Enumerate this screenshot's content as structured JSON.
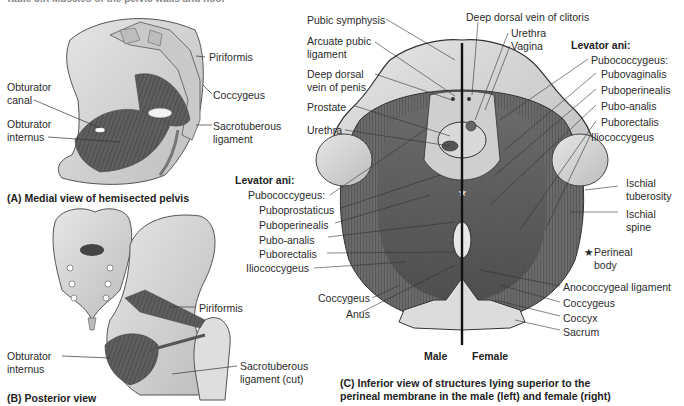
{
  "header_truncated": "Table 3.X Muscles of the pelvic walls and floor",
  "panel_a": {
    "caption": "(A) Medial view of hemisected pelvis",
    "labels": {
      "piriformis": "Piriformis",
      "coccygeus": "Coccygeus",
      "sacrotuberous_1": "Sacrotuberous",
      "sacrotuberous_2": "ligament",
      "obturator_canal_1": "Obturator",
      "obturator_canal_2": "canal",
      "obturator_internus_1": "Obturator",
      "obturator_internus_2": "internus"
    }
  },
  "panel_b": {
    "caption": "(B) Posterior view",
    "labels": {
      "piriformis": "Piriformis",
      "obturator_internus_1": "Obturator",
      "obturator_internus_2": "internus",
      "sacrotuberous_1": "Sacrotuberous",
      "sacrotuberous_2": "ligament (cut)"
    }
  },
  "panel_c": {
    "caption_1": "(C) Inferior view of structures lying superior to the",
    "caption_2": "perineal membrane in the male (left) and female (right)",
    "side_male": "Male",
    "side_female": "Female",
    "left_labels": {
      "pubic_symphysis": "Pubic symphysis",
      "arcuate_1": "Arcuate pubic",
      "arcuate_2": "ligament",
      "ddv_penis_1": "Deep dorsal",
      "ddv_penis_2": "vein of penis",
      "prostate": "Prostate",
      "urethra": "Urethra",
      "levator_ani": "Levator ani:",
      "pubococcygeus": "Pubococcygeus:",
      "puboprostaticus": "Puboprostaticus",
      "puboperinealis": "Puboperinealis",
      "pubo_analis": "Pubo-analis",
      "puborectalis": "Puborectalis",
      "iliococcygeus": "Iliococcygeus",
      "coccygeus": "Coccygeus",
      "anus": "Anus"
    },
    "top_labels": {
      "ddv_clitoris": "Deep dorsal vein of clitoris",
      "urethra": "Urethra",
      "vagina": "Vagina"
    },
    "right_labels": {
      "levator_ani": "Levator ani:",
      "pubococcygeus": "Pubococcygeus:",
      "pubovaginalis": "Pubovaginalis",
      "puboperinealis": "Puboperinealis",
      "pubo_analis": "Pubo-analis",
      "puborectalis": "Puborectalis",
      "iliococcygeus": "Iliococcygeus",
      "ischial_tuberosity_1": "Ischial",
      "ischial_tuberosity_2": "tuberosity",
      "ischial_spine_1": "Ischial",
      "ischial_spine_2": "spine",
      "perineal_body_star": "★",
      "perineal_body_1": "Perineal",
      "perineal_body_2": "body",
      "anococcygeal": "Anococcygeal ligament",
      "coccygeus": "Coccygeus",
      "coccyx": "Coccyx",
      "sacrum": "Sacrum"
    }
  }
}
